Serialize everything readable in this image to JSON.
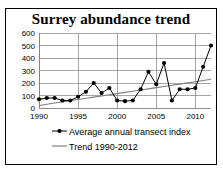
{
  "figure": {
    "title": "Surrey abundance trend",
    "border_color": "#000000",
    "background": "#ffffff"
  },
  "chart_data": {
    "type": "line",
    "title": "Surrey abundance trend",
    "xlabel": "",
    "ylabel": "",
    "xlim": [
      1990,
      2012
    ],
    "ylim": [
      0,
      600
    ],
    "grid": true,
    "legend_position": "bottom-left",
    "x_tick_labels": [
      "1990",
      "1995",
      "2000",
      "2005",
      "2010"
    ],
    "x_ticks": [
      1990,
      1995,
      2000,
      2005,
      2010
    ],
    "y_tick_labels": [
      "0",
      "100",
      "200",
      "300",
      "400",
      "500",
      "600"
    ],
    "y_ticks": [
      0,
      100,
      200,
      300,
      400,
      500,
      600
    ],
    "x": [
      1990,
      1991,
      1992,
      1993,
      1994,
      1995,
      1996,
      1997,
      1998,
      1999,
      2000,
      2001,
      2002,
      2003,
      2004,
      2005,
      2006,
      2007,
      2008,
      2009,
      2010,
      2011,
      2012
    ],
    "series": [
      {
        "name": "Average annual transect index",
        "color": "#000000",
        "marker": "circle",
        "values": [
          70,
          80,
          80,
          60,
          60,
          90,
          130,
          200,
          120,
          160,
          60,
          55,
          60,
          150,
          290,
          190,
          360,
          60,
          150,
          150,
          160,
          330,
          500
        ]
      },
      {
        "name": "Trend 1990-2012",
        "color": "#808080",
        "marker": "none",
        "values": [
          20,
          30,
          40,
          49,
          59,
          68,
          78,
          87,
          96,
          106,
          115,
          125,
          134,
          144,
          153,
          163,
          172,
          182,
          191,
          201,
          210,
          220,
          230
        ]
      }
    ],
    "legend": [
      {
        "label": "Average annual transect index",
        "color": "#000000",
        "marker": "circle"
      },
      {
        "label": "Trend 1990-2012",
        "color": "#808080",
        "marker": "none"
      }
    ]
  }
}
